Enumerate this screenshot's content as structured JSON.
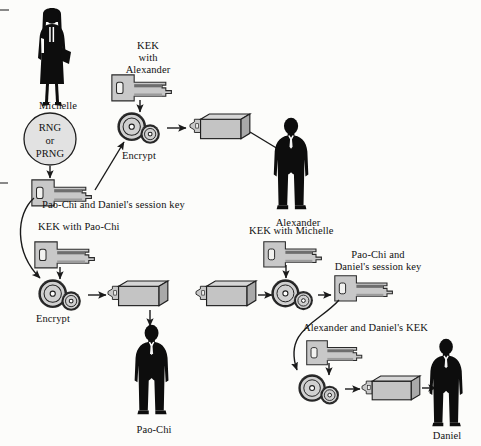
{
  "diagram": {
    "background_color": "#fcfcfa",
    "key_fill": "#c8c8c8",
    "box_fill": "#c4c4c4",
    "silhouette_color": "#0d0d0d",
    "line_color": "#1a1a1a"
  },
  "people": [
    {
      "id": "michelle",
      "name": "Michelle",
      "gender": "female"
    },
    {
      "id": "alexander",
      "name": "Alexander",
      "gender": "male"
    },
    {
      "id": "paochi",
      "name": "Pao-Chi",
      "gender": "male"
    },
    {
      "id": "daniel",
      "name": "Daniel",
      "gender": "male"
    }
  ],
  "generator": {
    "line1": "RNG",
    "line2": "or",
    "line3": "PRNG"
  },
  "keys": [
    {
      "id": "kek-alexander",
      "label": "KEK\nwith\nAlexander",
      "lines": [
        "KEK",
        "with",
        "Alexander"
      ]
    },
    {
      "id": "session-key-1",
      "label": "Pao-Chi and Daniel's session key",
      "lines": [
        "Pao-Chi and Daniel's session key"
      ]
    },
    {
      "id": "kek-paochi",
      "label": "KEK with Pao-Chi",
      "lines": [
        "KEK with Pao-Chi"
      ]
    },
    {
      "id": "kek-michelle",
      "label": "KEK with Michelle",
      "lines": [
        "KEK with Michelle"
      ]
    },
    {
      "id": "session-key-2",
      "label": "Pao-Chi and Daniel's session key",
      "lines": [
        "Pao-Chi and",
        "Daniel's session key"
      ]
    },
    {
      "id": "kek-alexander-daniel",
      "label": "Alexander and Daniel's KEK",
      "lines": [
        "Alexander and Daniel's KEK"
      ]
    }
  ],
  "operations": [
    {
      "id": "encrypt-top",
      "label": "Encrypt"
    },
    {
      "id": "encrypt-bottom",
      "label": "Encrypt"
    },
    {
      "id": "decrypt-middle",
      "label": ""
    },
    {
      "id": "encrypt-daniel",
      "label": ""
    }
  ],
  "labels": {
    "kek_alexander_l1": "KEK",
    "kek_alexander_l2": "with",
    "kek_alexander_l3": "Alexander",
    "rng_l1": "RNG",
    "rng_l2": "or",
    "rng_l3": "PRNG",
    "michelle": "Michelle",
    "alexander": "Alexander",
    "paochi": "Pao-Chi",
    "daniel": "Daniel",
    "encrypt_top": "Encrypt",
    "encrypt_bottom": "Encrypt",
    "session_key_1": "Pao-Chi and Daniel's session key",
    "kek_with_paochi": "KEK with Pao-Chi",
    "kek_with_michelle": "KEK with Michelle",
    "session_key_2_l1": "Pao-Chi and",
    "session_key_2_l2": "Daniel's session key",
    "alexander_daniel_kek": "Alexander and Daniel's KEK"
  }
}
